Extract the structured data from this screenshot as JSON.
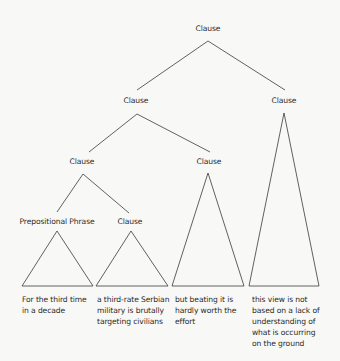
{
  "diagram": {
    "type": "syntax-tree",
    "nodes": {
      "root": {
        "label": "Clause"
      },
      "l2_left": {
        "label": "Clause"
      },
      "l2_right": {
        "label": "Clause"
      },
      "l3_left": {
        "label": "Clause"
      },
      "l3_right": {
        "label": "Clause"
      },
      "l4_left": {
        "label": "Prepositional Phrase"
      },
      "l4_right": {
        "label": "Clause"
      }
    },
    "leaves": [
      {
        "lines": [
          "For the third time",
          "in a decade"
        ]
      },
      {
        "lines": [
          "a third-rate Serbian",
          "military is brutally",
          "targeting civilians"
        ]
      },
      {
        "lines": [
          "but beating it is",
          "hardly worth the",
          "effort"
        ]
      },
      {
        "lines": [
          "this view is not",
          "based on a lack of",
          "understanding of",
          "what is occurring",
          "on the ground"
        ]
      }
    ],
    "stroke_color": "#3a3a3a"
  }
}
